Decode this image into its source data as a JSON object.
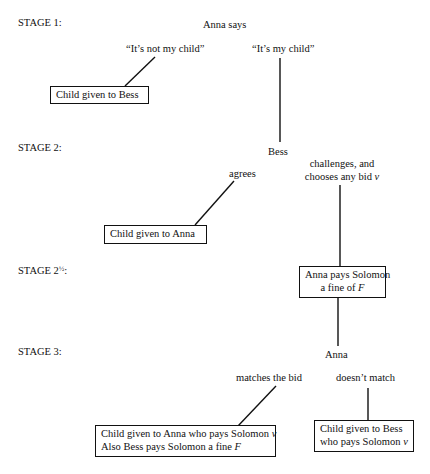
{
  "stages": {
    "s1": "STAGE 1:",
    "s2": "STAGE 2:",
    "s25_prefix": "STAGE 2",
    "s25_frac": "½",
    "s25_suffix": ":",
    "s3": "STAGE 3:"
  },
  "nodes": {
    "anna_says": "Anna says",
    "not_my_child": "“It’s not my child”",
    "my_child": "“It’s my child”",
    "child_to_bess_1": "Child given to Bess",
    "bess": "Bess",
    "agrees": "agrees",
    "challenges_l1": "challenges, and",
    "challenges_l2": "chooses any bid ",
    "bid_var": "v",
    "child_to_anna": "Child given to Anna",
    "fine_l1": "Anna pays Solomon",
    "fine_l2": "a fine of ",
    "fine_var": "F",
    "anna": "Anna",
    "matches": "matches the bid",
    "doesnt_match": "doesn’t match",
    "outcome_match_l1": "Child given to Anna who pays Solomon ",
    "outcome_match_var1": "v",
    "outcome_match_l2": "Also Bess pays Solomon a fine ",
    "outcome_match_var2": "F",
    "outcome_nomatch_l1": "Child given to Bess",
    "outcome_nomatch_l2": "who pays Solomon ",
    "outcome_nomatch_var": "v"
  }
}
